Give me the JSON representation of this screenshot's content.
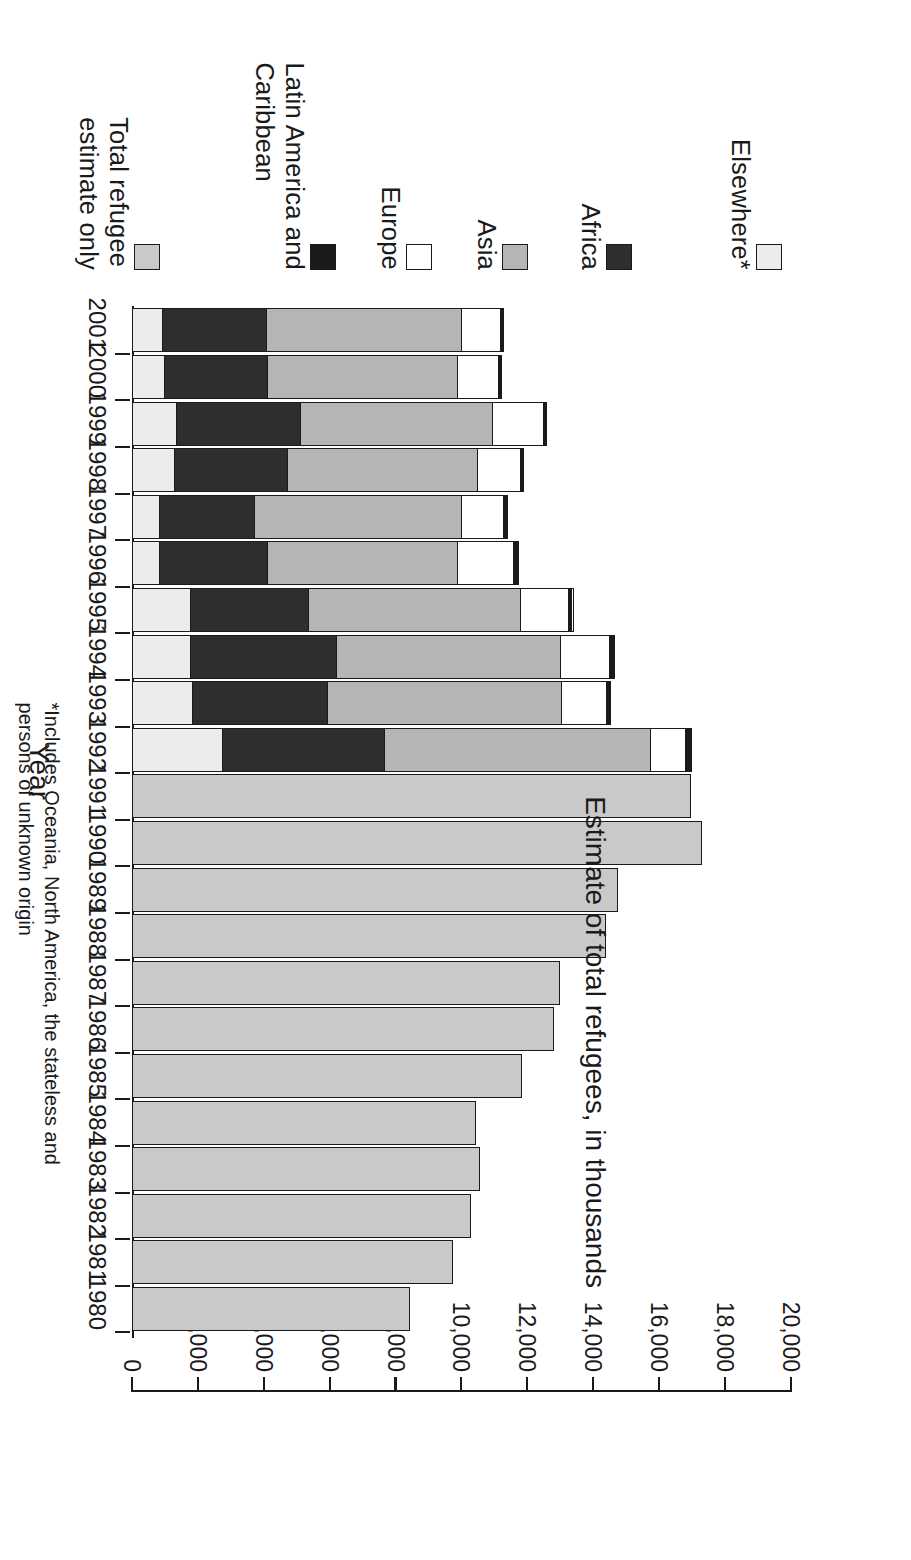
{
  "axes": {
    "value_axis_title": "Estimate of total refugees, in thousands",
    "category_axis_title": "Year",
    "value_ticks": [
      "0",
      "2,000",
      "4,000",
      "6,000",
      "8,000",
      "10,000",
      "12,000",
      "14,000",
      "16,000",
      "18,000",
      "20,000"
    ]
  },
  "footnote": "*Includes Oceania, North America, the stateless and\npersons of unknown origin",
  "legend": {
    "items": [
      {
        "label": "Total refugee\nestimate only",
        "color": "#c9c9c9",
        "key": "total"
      },
      {
        "label": "Latin America and\nCaribbean",
        "color": "#1a1a1a",
        "key": "latin_america"
      },
      {
        "label": "Europe",
        "color": "#ffffff",
        "key": "europe"
      },
      {
        "label": "Asia",
        "color": "#b5b5b5",
        "key": "asia"
      },
      {
        "label": "Africa",
        "color": "#2e2e2e",
        "key": "africa"
      },
      {
        "label": "Elsewhere*",
        "color": "#ececec",
        "key": "elsewhere"
      }
    ]
  },
  "chart_data": {
    "type": "bar",
    "orientation": "horizontal-stacked",
    "title": "",
    "xlabel": "Year",
    "ylabel": "Estimate of total refugees, in thousands",
    "ylim": [
      0,
      20000
    ],
    "grid": false,
    "legend_position": "right",
    "categories": [
      "1980",
      "1981",
      "1982",
      "1983",
      "1984",
      "1985",
      "1986",
      "1987",
      "1988",
      "1989",
      "1990",
      "1991",
      "1992",
      "1993",
      "1994",
      "1995",
      "1996",
      "1997",
      "1998",
      "1999",
      "2000",
      "2001"
    ],
    "series": [
      {
        "name": "Total refugee estimate only",
        "color": "#c9c9c9",
        "values": [
          8450,
          9750,
          10300,
          10550,
          10450,
          11850,
          12800,
          13000,
          14400,
          14750,
          17300,
          16950,
          null,
          null,
          null,
          null,
          null,
          null,
          null,
          null,
          null,
          null
        ]
      },
      {
        "name": "Elsewhere*",
        "color": "#ececec",
        "values": [
          null,
          null,
          null,
          null,
          null,
          null,
          null,
          null,
          null,
          null,
          null,
          null,
          2700,
          1800,
          1750,
          1750,
          800,
          800,
          1250,
          1300,
          950,
          900
        ]
      },
      {
        "name": "Africa",
        "color": "#2e2e2e",
        "values": [
          null,
          null,
          null,
          null,
          null,
          null,
          null,
          null,
          null,
          null,
          null,
          null,
          4950,
          4100,
          4450,
          3600,
          3300,
          2900,
          3450,
          3800,
          3150,
          3150
        ]
      },
      {
        "name": "Asia",
        "color": "#b5b5b5",
        "values": [
          null,
          null,
          null,
          null,
          null,
          null,
          null,
          null,
          null,
          null,
          null,
          null,
          8100,
          7150,
          6800,
          6450,
          5800,
          6300,
          5800,
          5850,
          5800,
          5950
        ]
      },
      {
        "name": "Europe",
        "color": "#ffffff",
        "values": [
          null,
          null,
          null,
          null,
          null,
          null,
          null,
          null,
          null,
          null,
          null,
          null,
          1050,
          1350,
          1500,
          1450,
          1700,
          1300,
          1300,
          1550,
          1250,
          1200
        ]
      },
      {
        "name": "Latin America and Caribbean",
        "color": "#1a1a1a",
        "values": [
          null,
          null,
          null,
          null,
          null,
          null,
          null,
          null,
          null,
          null,
          null,
          null,
          200,
          150,
          150,
          150,
          150,
          100,
          100,
          100,
          90,
          80
        ]
      }
    ],
    "totals": [
      8450,
      9750,
      10300,
      10550,
      10450,
      11850,
      12800,
      13000,
      14400,
      14750,
      17300,
      16950,
      17000,
      14550,
      14650,
      13400,
      11750,
      11400,
      11900,
      12600,
      11240,
      11280
    ]
  }
}
